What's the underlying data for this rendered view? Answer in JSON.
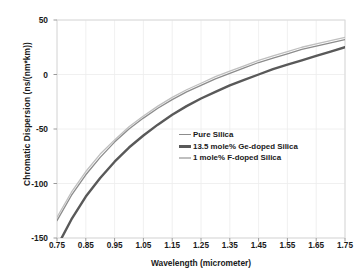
{
  "chart_data": {
    "type": "line",
    "title": "",
    "xlabel": "Wavelength (micrometer)",
    "ylabel": "Chromatic Dispersion  (ns/(nm*km))",
    "xlim": [
      0.75,
      1.75
    ],
    "ylim": [
      -150,
      50
    ],
    "xticks": [
      "0.75",
      "0.85",
      "0.95",
      "1.05",
      "1.15",
      "1.25",
      "1.35",
      "1.45",
      "1.55",
      "1.65",
      "1.75"
    ],
    "yticks": [
      "50",
      "0",
      "-50",
      "-100",
      "-150"
    ],
    "grid": true,
    "legend_position": "center-right",
    "x": [
      0.75,
      0.8,
      0.85,
      0.9,
      0.95,
      1.0,
      1.05,
      1.1,
      1.15,
      1.2,
      1.25,
      1.3,
      1.35,
      1.4,
      1.45,
      1.5,
      1.55,
      1.6,
      1.65,
      1.7,
      1.75
    ],
    "series": [
      {
        "name": "Pure Silica",
        "color": "#8c8c8c",
        "width": 1.3,
        "values": [
          -134,
          -111,
          -92,
          -76,
          -62,
          -50,
          -40,
          -31,
          -23,
          -16,
          -10,
          -4,
          1,
          6,
          11,
          15,
          19,
          23,
          26,
          29,
          32
        ]
      },
      {
        "name": "13.5 mole% Ge-doped Silica",
        "color": "#595959",
        "width": 2.4,
        "values": [
          -158,
          -133,
          -112,
          -95,
          -80,
          -67,
          -56,
          -46,
          -37,
          -29,
          -22,
          -16,
          -10,
          -5,
          0,
          5,
          9,
          13,
          17,
          21,
          25
        ]
      },
      {
        "name": "1 mole% F-doped Silica",
        "color": "#bfbfbf",
        "width": 1.3,
        "values": [
          -131,
          -108,
          -89,
          -73,
          -60,
          -48,
          -38,
          -29,
          -21,
          -14,
          -8,
          -2,
          3,
          8,
          13,
          17,
          21,
          25,
          28,
          31,
          34
        ]
      }
    ],
    "legend": [
      {
        "label": "Pure Silica",
        "color": "#8c8c8c",
        "thickness": 1.4
      },
      {
        "label": "13.5 mole% Ge-doped Silica",
        "color": "#595959",
        "thickness": 2.6
      },
      {
        "label": "1 mole% F-doped Silica",
        "color": "#bfbfbf",
        "thickness": 1.4
      }
    ],
    "axis_color": "#d9d9d9",
    "grid_color": "#ececec",
    "plot_bg": "#ffffff"
  }
}
